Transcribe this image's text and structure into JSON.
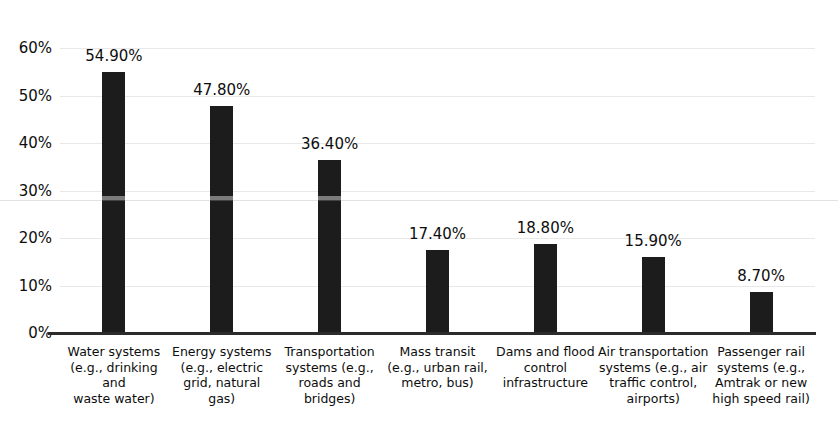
{
  "chart_data": {
    "type": "bar",
    "title": "",
    "title_clipped": true,
    "xlabel": "",
    "ylabel": "",
    "ylim": [
      0,
      60
    ],
    "ytick_labels": [
      "60%",
      "50%",
      "40%",
      "30%",
      "20%",
      "10%",
      "0%"
    ],
    "ytick_values": [
      60,
      50,
      40,
      30,
      20,
      10,
      0
    ],
    "grid": true,
    "grid_axis": "y",
    "legend": null,
    "bar_color": "#1c1c1c",
    "categories": [
      "Water systems (e.g., drinking and waste water)",
      "Energy systems (e.g., electric grid, natural gas)",
      "Transportation systems (e.g., roads and bridges)",
      "Mass transit (e.g., urban rail, metro, bus)",
      "Dams and flood control infrastructure",
      "Air transportation systems (e.g., air traffic control, airports)",
      "Passenger rail systems (e.g., Amtrak or new high speed rail)"
    ],
    "category_lines": [
      [
        "Water systems",
        "(e.g., drinking and",
        "waste water)"
      ],
      [
        "Energy systems",
        "(e.g., electric",
        "grid, natural",
        "gas)"
      ],
      [
        "Transportation",
        "systems (e.g.,",
        "roads and",
        "bridges)"
      ],
      [
        "Mass transit",
        "(e.g., urban rail,",
        "metro, bus)"
      ],
      [
        "Dams and flood",
        "control",
        "infrastructure"
      ],
      [
        "Air transportation",
        "systems (e.g., air",
        "traffic control,",
        "airports)"
      ],
      [
        "Passenger rail",
        "systems (e.g.,",
        "Amtrak or new",
        "high speed rail)"
      ]
    ],
    "values": [
      54.9,
      47.8,
      36.4,
      17.4,
      18.8,
      15.9,
      8.7
    ],
    "value_labels": [
      "54.90%",
      "47.80%",
      "36.40%",
      "17.40%",
      "18.80%",
      "15.90%",
      "8.70%"
    ]
  }
}
